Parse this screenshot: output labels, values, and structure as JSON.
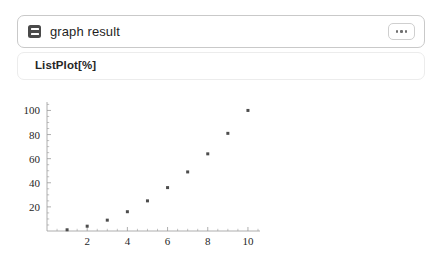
{
  "header": {
    "title": "graph result",
    "icon": "document-lines-icon",
    "more_label": "⋯"
  },
  "input_cell": {
    "expression": "ListPlot[%]"
  },
  "colors": {
    "card_border": "#c9c9c9",
    "input_border": "#ececec",
    "icon_fill": "#4a4a4a",
    "text": "#1f1f1f",
    "axis": "#9a9a9a",
    "point": "#4d4d4d",
    "background": "#ffffff"
  },
  "chart_data": {
    "type": "scatter",
    "title": "",
    "xlabel": "",
    "ylabel": "",
    "x": [
      1,
      2,
      3,
      4,
      5,
      6,
      7,
      8,
      9,
      10
    ],
    "values": [
      1,
      4,
      9,
      16,
      25,
      36,
      49,
      64,
      81,
      100
    ],
    "series": [
      {
        "name": "%",
        "values": [
          1,
          4,
          9,
          16,
          25,
          36,
          49,
          64,
          81,
          100
        ]
      }
    ],
    "xlim": [
      0,
      10.6
    ],
    "ylim": [
      0,
      107
    ],
    "xticks": [
      2,
      4,
      6,
      8,
      10
    ],
    "xticklabels": [
      "2",
      "4",
      "6",
      "8",
      "10"
    ],
    "yticks": [
      20,
      40,
      60,
      80,
      100
    ],
    "yticklabels": [
      "20",
      "40",
      "60",
      "80",
      "100"
    ],
    "x_minor_ticks": [
      0.5,
      1,
      1.5,
      2.5,
      3,
      3.5,
      4.5,
      5,
      5.5,
      6.5,
      7,
      7.5,
      8.5,
      9,
      9.5,
      10.5
    ],
    "y_minor_ticks": [
      5,
      10,
      15,
      25,
      30,
      35,
      45,
      50,
      55,
      65,
      70,
      75,
      85,
      90,
      95,
      105
    ],
    "grid": false,
    "legend": false
  }
}
